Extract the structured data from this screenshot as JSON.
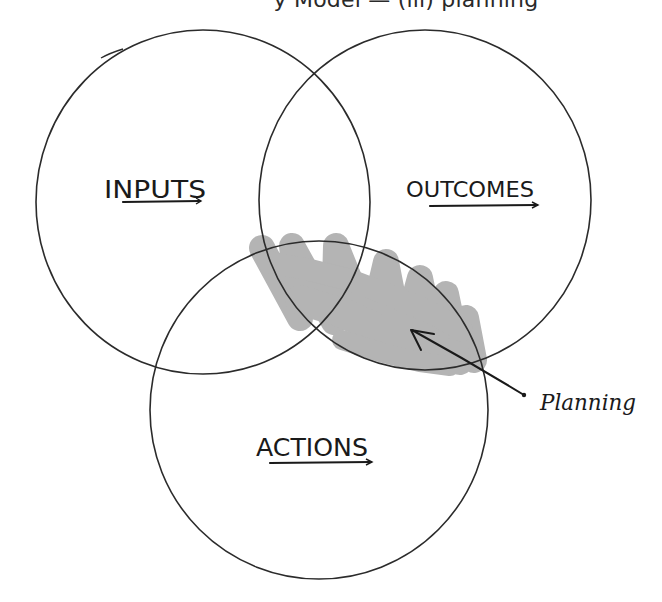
{
  "header": {
    "title_visible": "y Model  —  (iii) planning"
  },
  "diagram": {
    "type": "venn",
    "circles": [
      {
        "id": "inputs",
        "label": "INPUTS",
        "cx": 203,
        "cy": 202,
        "rx": 167,
        "ry": 172
      },
      {
        "id": "outcomes",
        "label": "OUTCOMES",
        "cx": 425,
        "cy": 200,
        "rx": 166,
        "ry": 170
      },
      {
        "id": "actions",
        "label": "ACTIONS",
        "cx": 319,
        "cy": 410,
        "rx": 169,
        "ry": 169
      }
    ],
    "highlight": {
      "region": "outcomes-actions overlap",
      "color": "#b4b4b4"
    },
    "annotation": {
      "label": "Planning",
      "arrow_from": [
        524,
        395
      ],
      "arrow_to": [
        412,
        330
      ]
    },
    "stroke_color": "#2b2b2b"
  }
}
